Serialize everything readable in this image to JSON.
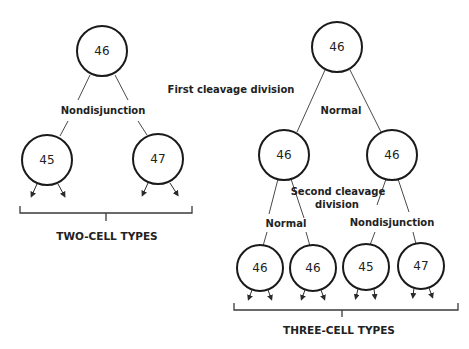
{
  "labels": {
    "first_cleavage": "First cleavage division",
    "second_cleavage_line1": "Second cleavage",
    "second_cleavage_line2": "division",
    "left_nondisjunction": "Nondisjunction",
    "right_top_normal": "Normal",
    "right_left_normal": "Normal",
    "right_right_nondisjunction": "Nondisjunction",
    "two_cell_types": "TWO-CELL TYPES",
    "three_cell_types": "THREE-CELL TYPES"
  },
  "left_tree": {
    "root": "46",
    "children": [
      "45",
      "47"
    ]
  },
  "right_tree": {
    "root": "46",
    "middle": [
      "46",
      "46"
    ],
    "leaves": [
      "46",
      "46",
      "45",
      "47"
    ]
  }
}
